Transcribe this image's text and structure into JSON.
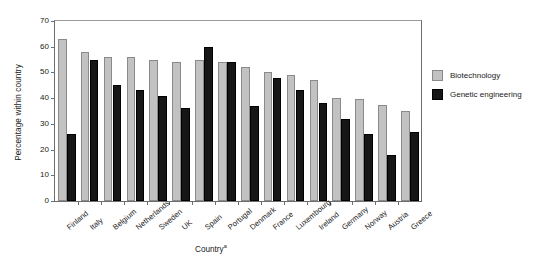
{
  "chart_data": {
    "type": "bar",
    "title": "",
    "xlabel": "Country",
    "xlabel_superscript": "a",
    "ylabel": "Percentage within country",
    "ylim": [
      0,
      70
    ],
    "yticks": [
      0,
      10,
      20,
      30,
      40,
      50,
      60,
      70
    ],
    "grid": false,
    "legend_position": "right",
    "categories": [
      "Finland",
      "Italy",
      "Belgium",
      "Netherlands",
      "Sweden",
      "UK",
      "Spain",
      "Portugal",
      "Denmark",
      "France",
      "Luxembourg",
      "Ireland",
      "Germany",
      "Norway",
      "Austria",
      "Greece"
    ],
    "series": [
      {
        "name": "Biotechnology",
        "color": "#c2c2c2",
        "values": [
          63,
          58,
          56,
          56,
          55,
          54,
          55,
          54,
          52,
          50,
          49,
          47,
          40,
          39.5,
          37.5,
          35
        ]
      },
      {
        "name": "Genetic engineering",
        "color": "#161616",
        "values": [
          26,
          55,
          45,
          43,
          41,
          36,
          60,
          54,
          37,
          48,
          43,
          38,
          32,
          26,
          18,
          27
        ]
      }
    ]
  },
  "legend": {
    "items": [
      {
        "label": "Biotechnology"
      },
      {
        "label": "Genetic engineering"
      }
    ]
  }
}
